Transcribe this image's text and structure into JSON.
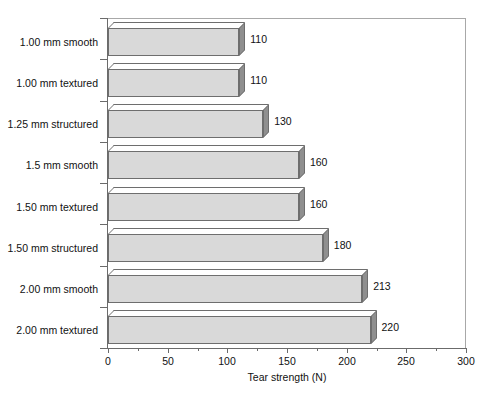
{
  "page_header": {
    "left_text": "",
    "right_text": ""
  },
  "chart_data": {
    "type": "bar",
    "orientation": "horizontal",
    "title": "",
    "xlabel": "Tear strength (N)",
    "ylabel": "",
    "xlim": [
      0,
      300
    ],
    "xticks": [
      0,
      50,
      100,
      150,
      200,
      250,
      300
    ],
    "xtick_labels": [
      "0",
      "50",
      "100",
      "150",
      "200",
      "250",
      "300"
    ],
    "minor_tick_step": 25,
    "grid": false,
    "legend": null,
    "categories": [
      "1.00 mm smooth",
      "1.00 mm textured",
      "1.25 mm structured",
      "1.5 mm smooth",
      "1.50 mm textured",
      "1.50 mm structured",
      "2.00 mm smooth",
      "2.00 mm textured"
    ],
    "values": [
      110,
      110,
      130,
      160,
      160,
      180,
      213,
      220
    ],
    "value_labels": [
      "110",
      "110",
      "130",
      "160",
      "160",
      "180",
      "213",
      "220"
    ],
    "colors": {
      "bar_front": "#d9d9d9",
      "bar_side": "#8f8f8f",
      "bar_top": "#ffffff",
      "bar_outline": "#6e6e6e",
      "axis": "#6b6b6b",
      "frame": "#a8a8a8",
      "text": "#111111",
      "background": "#ffffff"
    }
  }
}
